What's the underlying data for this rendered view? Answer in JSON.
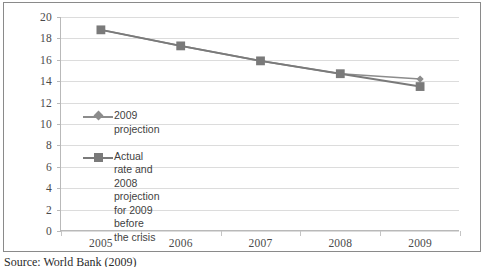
{
  "chart_data": {
    "type": "line",
    "title": "",
    "subtitle": "",
    "xlabel": "",
    "ylabel": "",
    "categories": [
      "2005",
      "2006",
      "2007",
      "2008",
      "2009"
    ],
    "xlim": [
      2005,
      2009
    ],
    "ylim": [
      0,
      20
    ],
    "ytick_step": 2,
    "yticks": [
      "20",
      "18",
      "16",
      "14",
      "12",
      "10",
      "8",
      "6",
      "4",
      "2",
      "0"
    ],
    "grid": "horizontal",
    "legend_position": "inside-left",
    "series": [
      {
        "name": "2009 projection",
        "marker": "diamond",
        "color": "#8c8c8c",
        "x": [
          "2005",
          "2006",
          "2007",
          "2008",
          "2009"
        ],
        "values": [
          18.8,
          17.3,
          15.9,
          14.7,
          14.2
        ]
      },
      {
        "name": "Actual rate and 2008 projection for 2009 before the crisis",
        "marker": "square",
        "color": "#7a7a7a",
        "x": [
          "2005",
          "2006",
          "2007",
          "2008",
          "2009"
        ],
        "values": [
          18.8,
          17.3,
          15.9,
          14.7,
          13.5
        ]
      }
    ]
  },
  "legend": {
    "entries": [
      {
        "label": "2009 projection",
        "marker": "diamond"
      },
      {
        "label": "Actual rate and 2008\nprojection for 2009 before\nthe crisis",
        "marker": "square"
      }
    ]
  },
  "source": {
    "text": "Source: World Bank (2009)"
  },
  "colors": {
    "series_1": "#8c8c8c",
    "series_2": "#7a7a7a",
    "grid": "#dcdcdc",
    "axis": "#b9b9b9",
    "frame": "#8a8a8a",
    "text": "#4a4a4a"
  }
}
